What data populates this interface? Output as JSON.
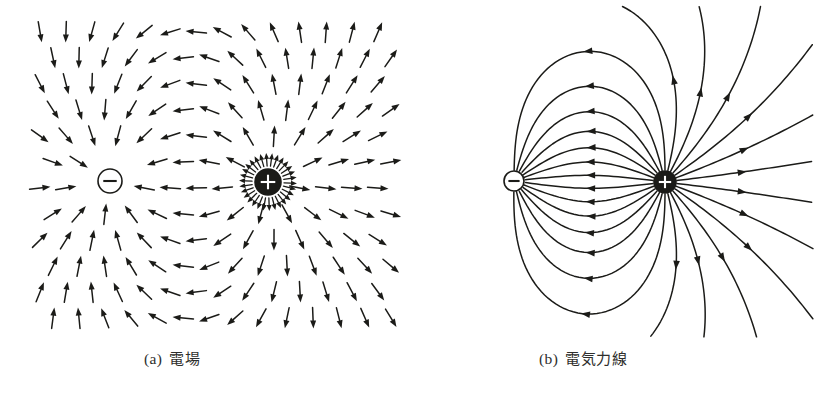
{
  "figure": {
    "kind": "physics-textbook-figure",
    "background_color": "#ffffff",
    "ink_color": "#1b1b18",
    "caption_color": "#2e2e2c",
    "panels": [
      {
        "id": "a",
        "tag": "(a)",
        "caption": "電場",
        "caption_romaji_meaning": "electric field",
        "representation": "vector-arrow-grid",
        "charges": [
          {
            "sign": "-",
            "glyph": "−",
            "cx": 110,
            "cy": 181,
            "r": 12,
            "fill": "#ffffff",
            "stroke": "#1b1b18"
          },
          {
            "sign": "+",
            "glyph": "+",
            "cx": 268,
            "cy": 182,
            "r": 13,
            "fill": "#1b1b18",
            "stroke": "#1b1b18"
          }
        ]
      },
      {
        "id": "b",
        "tag": "(b)",
        "caption": "電気力線",
        "caption_romaji_meaning": "electric lines of force",
        "representation": "continuous-field-lines",
        "charges": [
          {
            "sign": "-",
            "glyph": "−",
            "cx": 103,
            "cy": 181,
            "r": 10,
            "fill": "#ffffff",
            "stroke": "#1b1b18"
          },
          {
            "sign": "+",
            "glyph": "+",
            "cx": 254,
            "cy": 182,
            "r": 11,
            "fill": "#1b1b18",
            "stroke": "#1b1b18"
          }
        ]
      }
    ]
  },
  "chart_data": {
    "type": "scatter",
    "title": "",
    "subtitle": "",
    "xlabel": "",
    "ylabel": "",
    "grid": false,
    "legend": "none",
    "physical_model": "point-dipole",
    "panel_a": {
      "name": "電場",
      "render": "arrow-vectors",
      "xlim": [
        0,
        410
      ],
      "ylim": [
        0,
        345
      ],
      "charges": [
        {
          "q": -1,
          "x": 110,
          "y": 181
        },
        {
          "q": 1,
          "x": 268,
          "y": 182
        }
      ],
      "grid_spacing": 26,
      "arrow_length": 21,
      "arrow_head_length": 8,
      "arrow_head_width": 6,
      "min_field_radius": 17,
      "ring_radius": 22,
      "ring_arrow_count": 30,
      "ring_arrow_length": 13
    },
    "panel_b": {
      "name": "電気力線",
      "render": "streamlines",
      "xlim": [
        0,
        410
      ],
      "ylim": [
        0,
        345
      ],
      "charges": [
        {
          "q": -1,
          "x": 103,
          "y": 181
        },
        {
          "q": 1,
          "x": 254,
          "y": 182
        }
      ],
      "line_count": 26,
      "line_width": 1.5,
      "start_radius": 12,
      "step_length": 1.6,
      "max_steps": 1400,
      "arrowheads_per_line": 1
    }
  },
  "captions": {
    "a_tag": "(a)",
    "a_text": "電場",
    "b_tag": "(b)",
    "b_text": "電気力線"
  }
}
